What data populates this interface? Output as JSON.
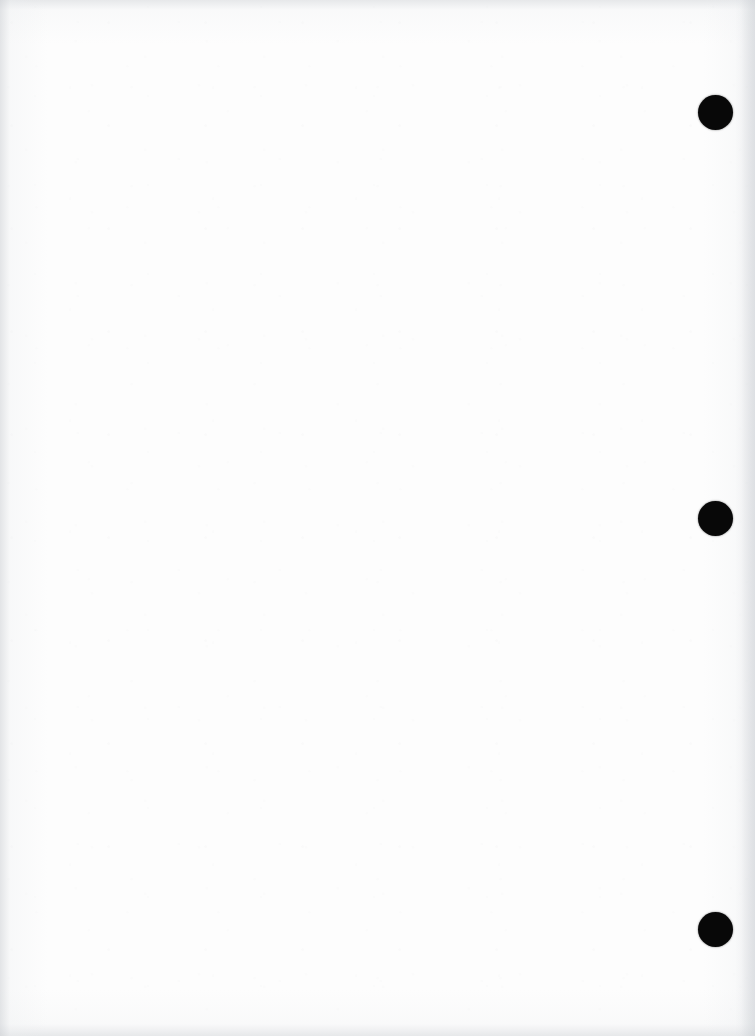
{
  "page": {
    "kind": "scanned-blank-page",
    "width": 755,
    "height": 1036,
    "background_color": "#ffffff",
    "paper_color": "#fdfdfd",
    "body_text": "",
    "notes_label": ""
  },
  "marks": {
    "label": "registration-dots",
    "color": "#080808",
    "count": 3,
    "diameter": 35,
    "items": [
      {
        "id": "dot-1",
        "label": "",
        "x": 698,
        "y": 95
      },
      {
        "id": "dot-2",
        "label": "",
        "x": 698,
        "y": 501
      },
      {
        "id": "dot-3",
        "label": "",
        "x": 698,
        "y": 912
      }
    ]
  },
  "artifacts": {
    "ghost_text": {
      "visible": true,
      "legible": false,
      "content": "          \n                "
    },
    "vignette_color": "#cdd0d4",
    "grain_color": "#969ba0"
  }
}
